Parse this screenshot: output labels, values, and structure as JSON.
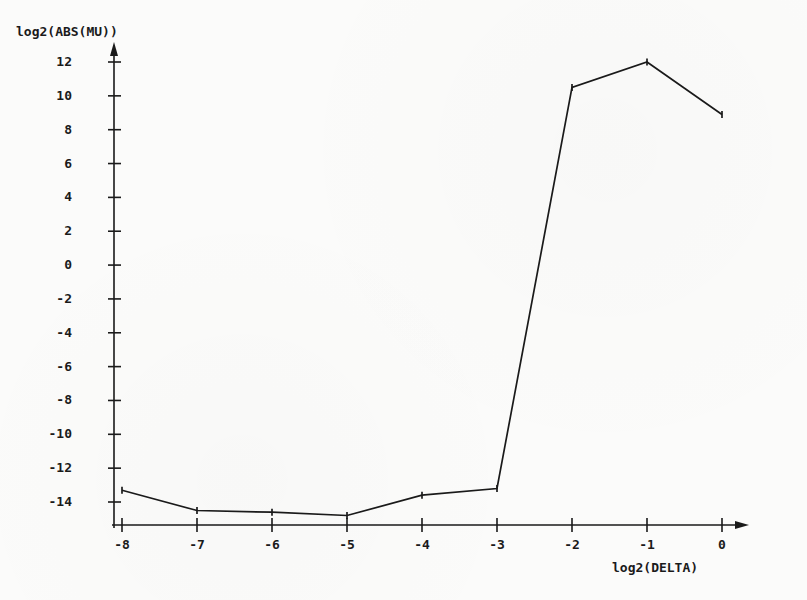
{
  "chart_data": {
    "type": "line",
    "title": "",
    "xlabel": "log2(DELTA)",
    "ylabel": "log2(ABS(MU))",
    "x": [
      -8,
      -7,
      -6,
      -5,
      -4,
      -3,
      -2,
      -1,
      0
    ],
    "values": [
      -13.3,
      -14.5,
      -14.6,
      -14.8,
      -13.6,
      -13.2,
      10.5,
      12.0,
      8.9
    ],
    "series": [
      {
        "name": "log2(ABS(MU))",
        "values": [
          -13.3,
          -14.5,
          -14.6,
          -14.8,
          -13.6,
          -13.2,
          10.5,
          12.0,
          8.9
        ]
      }
    ],
    "xlim": [
      -8.2,
      0.4
    ],
    "ylim": [
      -16,
      13
    ],
    "xticks": [
      -8,
      -7,
      -6,
      -5,
      -4,
      -3,
      -2,
      -1,
      0
    ],
    "yticks": [
      12,
      10,
      8,
      6,
      4,
      2,
      0,
      -2,
      -4,
      -6,
      -8,
      -10,
      -12,
      -14
    ],
    "xtick_labels": [
      "-8",
      "-7",
      "-6",
      "-5",
      "-4",
      "-3",
      "-2",
      "-1",
      "0"
    ],
    "ytick_labels": [
      "12",
      "10",
      "8",
      "6",
      "4",
      "2",
      "0",
      "-2",
      "-4",
      "-6",
      "-8",
      "-10",
      "-12",
      "-14"
    ],
    "grid": false,
    "legend": "none",
    "line_color": "#1a1a1a",
    "marker": "tick",
    "axis_style": "arrow",
    "background_color": "#fbfbfa"
  },
  "axes": {
    "y_title": "log2(ABS(MU))",
    "x_title": "log2(DELTA)"
  }
}
